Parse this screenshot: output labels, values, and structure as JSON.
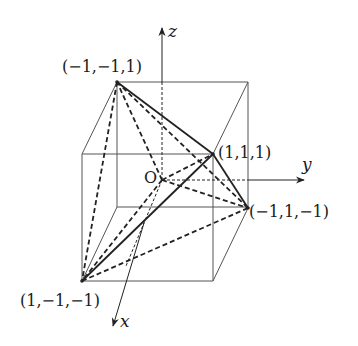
{
  "figure": {
    "type": "3d-cube-tetrahedron-diagram",
    "axes": {
      "x_label": "x",
      "y_label": "y",
      "z_label": "z",
      "origin_label": "O"
    },
    "vertex_labels": {
      "top_back_left": "(−1,−1,1)",
      "top_front_right": "(1,1,1)",
      "bottom_back_right": "(−1,1,−1)",
      "bottom_front_left": "(1,−1,−1)"
    },
    "colors": {
      "line": "#222222",
      "cube_edge": "#555555",
      "background": "#ffffff"
    }
  }
}
